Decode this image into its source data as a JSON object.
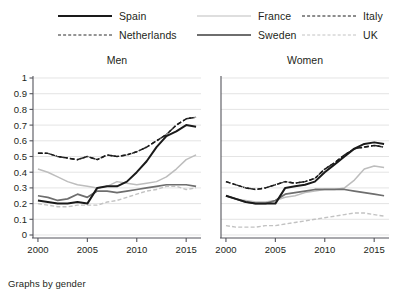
{
  "caption": "Graphs by gender",
  "legend": {
    "position": "top",
    "entries": [
      {
        "label": "Spain",
        "key": "spain",
        "style": "solid-thick-black"
      },
      {
        "label": "France",
        "key": "france",
        "style": "solid-light-gray"
      },
      {
        "label": "Italy",
        "key": "italy",
        "style": "dashed-black"
      },
      {
        "label": "Netherlands",
        "key": "neth",
        "style": "dash-dot-black"
      },
      {
        "label": "Sweden",
        "key": "sweden",
        "style": "solid-medium-gray"
      },
      {
        "label": "UK",
        "key": "uk",
        "style": "dashed-light-gray"
      }
    ]
  },
  "colors": {
    "spain": "#1a1a1a",
    "netherlands": "#2b2b2b",
    "france": "#bdbdbd",
    "sweden": "#6e6e6e",
    "italy": "#1a1a1a",
    "uk": "#c2c2c2",
    "grid": "#d9d9d9",
    "axis": "#55555c",
    "background": "#ffffff"
  },
  "chart_data": {
    "type": "line",
    "title": "",
    "xlabel": "",
    "ylabel": "",
    "xlim": [
      1999.5,
      2016.5
    ],
    "ylim": [
      0,
      1
    ],
    "grid": true,
    "legend_position": "top",
    "ytick_labels": [
      "0",
      "0.1",
      "0.2",
      "0.3",
      "0.4",
      "0.5",
      "0.6",
      "0.7",
      "0.8",
      "0.9",
      "1"
    ],
    "ytick_values": [
      0,
      0.1,
      0.2,
      0.3,
      0.4,
      0.5,
      0.6,
      0.7,
      0.8,
      0.9,
      1
    ],
    "xtick_labels": [
      "2000",
      "2005",
      "2010",
      "2015"
    ],
    "xtick_values": [
      2000,
      2005,
      2010,
      2015
    ],
    "x": [
      2000,
      2001,
      2002,
      2003,
      2004,
      2005,
      2006,
      2007,
      2008,
      2009,
      2010,
      2011,
      2012,
      2013,
      2014,
      2015,
      2016
    ],
    "panels": [
      {
        "name": "Men",
        "series": [
          {
            "name": "Spain",
            "values": [
              0.22,
              0.21,
              0.2,
              0.2,
              0.21,
              0.2,
              0.3,
              0.31,
              0.31,
              0.34,
              0.4,
              0.47,
              0.56,
              0.63,
              0.66,
              0.7,
              0.69
            ]
          },
          {
            "name": "Netherlands",
            "values": [
              0.52,
              0.52,
              0.5,
              0.49,
              0.48,
              0.5,
              0.48,
              0.51,
              0.5,
              0.51,
              0.53,
              0.56,
              0.6,
              0.64,
              0.7,
              0.74,
              0.75
            ]
          },
          {
            "name": "France",
            "values": [
              0.42,
              0.4,
              0.37,
              0.34,
              0.32,
              0.31,
              0.3,
              0.31,
              0.34,
              0.33,
              0.32,
              0.33,
              0.34,
              0.37,
              0.42,
              0.48,
              0.51
            ]
          },
          {
            "name": "Sweden",
            "values": [
              0.25,
              0.24,
              0.22,
              0.23,
              0.26,
              0.24,
              0.28,
              0.28,
              0.27,
              0.28,
              0.29,
              0.3,
              0.31,
              0.32,
              0.32,
              0.32,
              0.31
            ]
          },
          {
            "name": "Italy",
            "values": [
              0.52,
              0.52,
              0.5,
              0.49,
              0.48,
              0.5,
              0.48,
              0.51,
              0.5,
              0.51,
              0.53,
              0.56,
              0.6,
              0.64,
              0.7,
              0.74,
              0.75
            ]
          },
          {
            "name": "UK",
            "values": [
              0.2,
              0.19,
              0.18,
              0.18,
              0.19,
              0.19,
              0.19,
              0.21,
              0.22,
              0.24,
              0.26,
              0.28,
              0.29,
              0.31,
              0.31,
              0.29,
              0.3
            ]
          }
        ]
      },
      {
        "name": "Women",
        "series": [
          {
            "name": "Spain",
            "values": [
              0.25,
              0.23,
              0.21,
              0.2,
              0.2,
              0.2,
              0.3,
              0.31,
              0.32,
              0.34,
              0.4,
              0.45,
              0.5,
              0.55,
              0.58,
              0.59,
              0.58
            ]
          },
          {
            "name": "Netherlands",
            "values": [
              0.34,
              0.32,
              0.3,
              0.29,
              0.3,
              0.32,
              0.34,
              0.33,
              0.34,
              0.36,
              0.42,
              0.46,
              0.51,
              0.55,
              0.56,
              0.57,
              0.56
            ]
          },
          {
            "name": "France",
            "values": [
              0.25,
              0.23,
              0.22,
              0.21,
              0.21,
              0.22,
              0.24,
              0.25,
              0.27,
              0.28,
              0.29,
              0.29,
              0.3,
              0.35,
              0.42,
              0.44,
              0.43
            ]
          },
          {
            "name": "Sweden",
            "values": [
              0.25,
              0.23,
              0.21,
              0.2,
              0.2,
              0.22,
              0.26,
              0.27,
              0.28,
              0.29,
              0.29,
              0.29,
              0.29,
              0.28,
              0.27,
              0.26,
              0.25
            ]
          },
          {
            "name": "Italy",
            "values": [
              0.34,
              0.32,
              0.3,
              0.29,
              0.3,
              0.32,
              0.34,
              0.33,
              0.34,
              0.36,
              0.42,
              0.46,
              0.51,
              0.55,
              0.56,
              0.57,
              0.56
            ]
          },
          {
            "name": "UK",
            "values": [
              0.06,
              0.05,
              0.05,
              0.05,
              0.06,
              0.06,
              0.07,
              0.08,
              0.09,
              0.1,
              0.11,
              0.12,
              0.13,
              0.14,
              0.14,
              0.13,
              0.12
            ]
          }
        ]
      }
    ]
  }
}
